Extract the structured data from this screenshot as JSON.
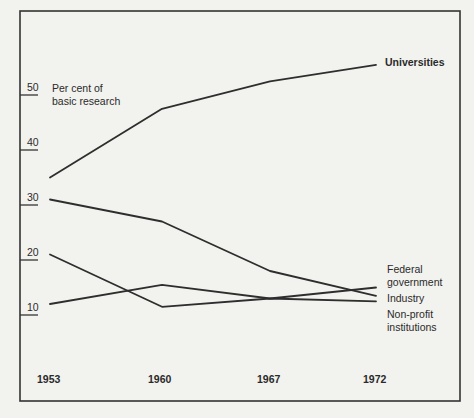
{
  "chart_data": {
    "type": "line",
    "title": "",
    "ylabel": "Per cent of basic research",
    "ylabel_lines": [
      "Per cent of",
      "basic research"
    ],
    "xlabel": "",
    "x": [
      "1953",
      "1960",
      "1967",
      "1972"
    ],
    "yticks": [
      10,
      20,
      30,
      40,
      50
    ],
    "ylim": [
      5,
      58
    ],
    "grid": false,
    "legend_position": "inline-right",
    "series": [
      {
        "name": "Universities",
        "label_lines": [
          "Universities"
        ],
        "values": [
          35,
          47.5,
          52.5,
          55.5
        ]
      },
      {
        "name": "Federal government",
        "label_lines": [
          "Federal",
          "government"
        ],
        "values": [
          31,
          27,
          18,
          13.5
        ]
      },
      {
        "name": "Industry",
        "label_lines": [
          "Industry"
        ],
        "values": [
          12,
          15.5,
          13,
          15
        ]
      },
      {
        "name": "Non-profit institutions",
        "label_lines": [
          "Non-profit",
          "institutions"
        ],
        "values": [
          21,
          11.5,
          13,
          12.5
        ]
      }
    ]
  },
  "axis": {
    "ylabel_line1": "Per cent of",
    "ylabel_line2": "basic research",
    "ticks": [
      "50",
      "40",
      "30",
      "20",
      "10"
    ],
    "years": [
      "1953",
      "1960",
      "1967",
      "1972"
    ]
  },
  "legend": {
    "universities": "Universities",
    "federal_line1": "Federal",
    "federal_line2": "government",
    "industry": "Industry",
    "nonprofit_line1": "Non-profit",
    "nonprofit_line2": "institutions"
  }
}
